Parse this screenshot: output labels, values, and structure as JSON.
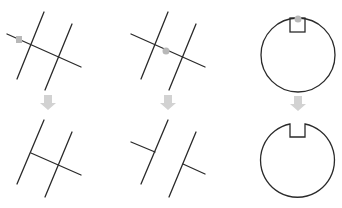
{
  "diagram": {
    "colors": {
      "line": "#2a2a2a",
      "arrow": "#cfcfcf",
      "pick_marker": "#b8b8b8",
      "background": "#ffffff"
    },
    "panels": [
      {
        "id": "trim-crossing-segment",
        "before": "two parallel lines crossed by a transversal, pick at left end",
        "after": "transversal trimmed to segment between parallel lines"
      },
      {
        "id": "trim-middle-segment",
        "before": "two parallel lines crossed by a transversal, pick between the lines",
        "after": "middle portion of transversal removed"
      },
      {
        "id": "trim-circle-notch",
        "before": "circle with square notch, pick on arc at top",
        "after": "arc inside notch removed"
      }
    ]
  }
}
